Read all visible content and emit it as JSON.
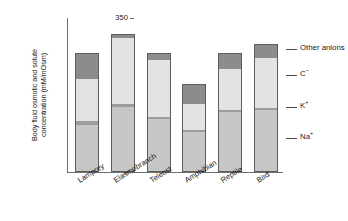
{
  "chart_data": {
    "type": "bar",
    "stacked": true,
    "title": "",
    "xlabel": "",
    "ylabel": "Body fluid osmotic and solute concentration (mM/mOsm)",
    "ylabel_lines": [
      "Body fluid osmotic and solute",
      "concentration (mM/mOsm)"
    ],
    "ylim": [
      0,
      350
    ],
    "yticks": [
      0,
      50,
      100,
      150,
      200,
      250,
      300,
      350
    ],
    "ytick_labels": [
      "0",
      "50",
      "100",
      "150",
      "200",
      "250",
      "300",
      "350"
    ],
    "grid": false,
    "legend_position": "right",
    "categories": [
      "Lamprey",
      "Elasmobranch",
      "Teleost",
      "Amphibian",
      "Reptile",
      "Bird"
    ],
    "series": [
      {
        "name": "Na+",
        "label": "Na",
        "charge": "+",
        "color": "#c6c6c6",
        "values": [
          105,
          145,
          118,
          88,
          133,
          138
        ]
      },
      {
        "name": "K+",
        "label": "K",
        "charge": "+",
        "color": "#9d9d9d",
        "values": [
          8,
          8,
          5,
          5,
          6,
          6
        ]
      },
      {
        "name": "Cl-",
        "label": "C",
        "charge": "−",
        "color": "#e3e3e3",
        "values": [
          95,
          150,
          130,
          60,
          92,
          113
        ]
      },
      {
        "name": "Other anions",
        "label": "Other anions",
        "charge": "",
        "color": "#8c8c8c",
        "values": [
          62,
          10,
          18,
          48,
          39,
          33
        ]
      }
    ],
    "totals": [
      270,
      313,
      271,
      201,
      270,
      290
    ]
  },
  "legend": {
    "items": [
      {
        "key": "other",
        "text": "Other anions",
        "sup": ""
      },
      {
        "key": "cl",
        "text": "C",
        "sup": "−"
      },
      {
        "key": "k",
        "text": "K",
        "sup": "+"
      },
      {
        "key": "na",
        "text": "Na",
        "sup": "+"
      }
    ]
  }
}
